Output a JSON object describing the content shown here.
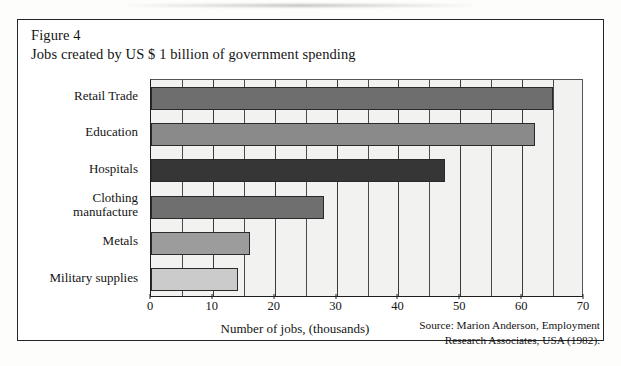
{
  "figure": {
    "label": "Figure 4",
    "title": "Jobs created by US $ 1 billion of government spending"
  },
  "source": {
    "line1": "Source: Marion Anderson, Employment",
    "line2": "Research Associates, USA (1982)."
  },
  "chart_data": {
    "type": "bar",
    "orientation": "horizontal",
    "title": "Jobs created by US $ 1 billion of government spending",
    "xlabel": "Number of jobs, (thousands)",
    "ylabel": "",
    "xlim": [
      0,
      70
    ],
    "xticks": [
      0,
      10,
      20,
      30,
      40,
      50,
      60,
      70
    ],
    "xtick_labels": [
      "0",
      "10",
      "20",
      "30",
      "40",
      "50",
      "60",
      "70"
    ],
    "gridlines": [
      5,
      10,
      15,
      20,
      25,
      30,
      35,
      40,
      45,
      50,
      55,
      60,
      65
    ],
    "grid": true,
    "legend": "none",
    "categories": [
      "Retail Trade",
      "Education",
      "Hospitals",
      "Clothing manufacture",
      "Metals",
      "Military supplies"
    ],
    "category_label_lines": [
      [
        "Retail Trade"
      ],
      [
        "Education"
      ],
      [
        "Hospitals"
      ],
      [
        "Clothing",
        "manufacture"
      ],
      [
        "Metals"
      ],
      [
        "Military supplies"
      ]
    ],
    "values": [
      65,
      62,
      47.5,
      28,
      16,
      14
    ],
    "bar_colors": [
      "#6e6e6e",
      "#8a8a8a",
      "#363636",
      "#6f6f6f",
      "#9c9c9c",
      "#cbcbcb"
    ],
    "plot_background": "#f2f2f0"
  }
}
